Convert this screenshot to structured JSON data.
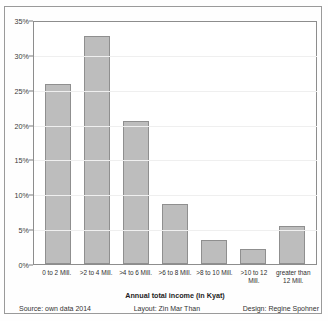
{
  "chart_data": {
    "type": "bar",
    "title": "",
    "xlabel": "Annual total income (in Kyat)",
    "ylabel": "",
    "categories": [
      "0 to 2 Mill.",
      ">2 to 4 Mill.",
      ">4 to 6 Mill.",
      ">6 to 8 Mill.",
      ">8 to 10 Mill.",
      ">10 to 12 Mill.",
      "greater than 12 Mill."
    ],
    "values": [
      26.0,
      33.0,
      20.7,
      8.7,
      3.5,
      2.2,
      5.5
    ],
    "ylim": [
      0,
      35
    ],
    "yticks": [
      "0%",
      "5%",
      "10%",
      "15%",
      "20%",
      "25%",
      "30%",
      "35%"
    ],
    "ytick_values": [
      0,
      5,
      10,
      15,
      20,
      25,
      30,
      35
    ],
    "grid": true,
    "legend": false,
    "bar_color": "#bdbdbd",
    "bar_border_color": "#8f8f8f"
  },
  "footer": {
    "source": "Source: own data 2014",
    "layout": "Layout: Zin Mar Than",
    "design": "Design: Regine Spohner"
  }
}
